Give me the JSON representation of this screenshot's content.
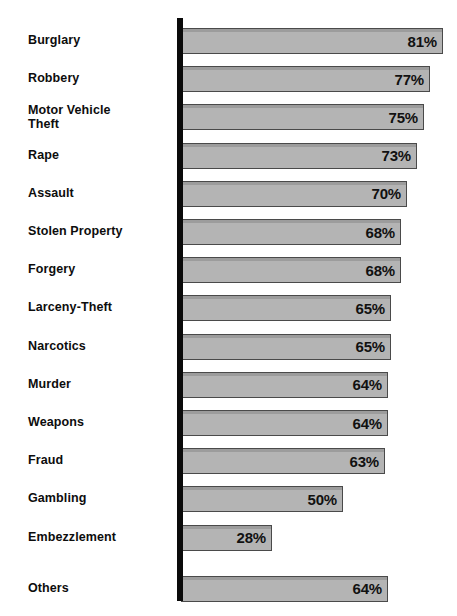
{
  "chart_data": {
    "type": "bar",
    "title": "",
    "subtitle": "",
    "xlabel": "",
    "ylabel": "",
    "orientation": "horizontal",
    "grid": false,
    "legend": false,
    "xlim": [
      0,
      100
    ],
    "value_suffix": "%",
    "categories": [
      "Burglary",
      "Robbery",
      "Motor Vehicle\nTheft",
      "Rape",
      "Assault",
      "Stolen Property",
      "Forgery",
      "Larceny-Theft",
      "Narcotics",
      "Murder",
      "Weapons",
      "Fraud",
      "Gambling",
      "Embezzlement",
      "Others"
    ],
    "values": [
      81,
      77,
      75,
      73,
      70,
      68,
      68,
      65,
      65,
      64,
      64,
      63,
      50,
      28,
      64
    ],
    "value_labels": [
      "81%",
      "77%",
      "75%",
      "73%",
      "70%",
      "68%",
      "68%",
      "65%",
      "65%",
      "64%",
      "64%",
      "63%",
      "50%",
      "28%",
      "64%"
    ],
    "colors": {
      "bar_fill": "#b4b4b4",
      "bar_border": "#4a4a4a",
      "axis": "#0a0a0a",
      "label_text": "#0d0d0d",
      "value_text": "#111111",
      "background": "#ffffff"
    }
  }
}
